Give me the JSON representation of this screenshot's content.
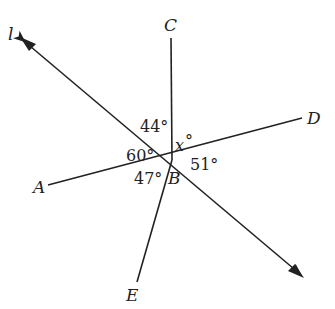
{
  "diagram": {
    "type": "intersecting-lines",
    "center_point": "B",
    "lines": [
      {
        "name": "l",
        "label": "l",
        "description": "line l with arrows both ends",
        "from": [
          20,
          38
        ],
        "to": [
          303,
          277
        ]
      },
      {
        "name": "BC",
        "label": "C",
        "from": [
          172,
          160
        ],
        "to": [
          171,
          38
        ]
      },
      {
        "name": "AD",
        "label_a": "A",
        "label_d": "D",
        "from": [
          48,
          185
        ],
        "to": [
          302,
          118
        ]
      },
      {
        "name": "BE",
        "label": "E",
        "from": [
          172,
          160
        ],
        "to": [
          137,
          282
        ]
      }
    ],
    "labels": {
      "l": "l",
      "C": "C",
      "D": "D",
      "A": "A",
      "B": "B",
      "E": "E"
    },
    "angles": {
      "a44": "44°",
      "a60": "60°",
      "a47": "47°",
      "a51": "51°",
      "x_var": "x",
      "x_deg": "°"
    },
    "colors": {
      "stroke": "#222222",
      "background": "#ffffff"
    }
  }
}
